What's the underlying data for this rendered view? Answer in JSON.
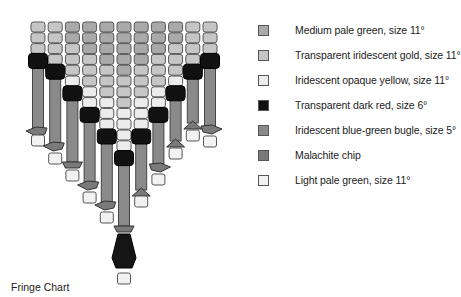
{
  "caption": "Fringe Chart",
  "colors": {
    "medium_pale_green": "#a9a9a9",
    "transparent_iridescent_gold": "#c6c6c6",
    "iridescent_opaque_yellow": "#ececec",
    "transparent_dark_red": "#111111",
    "blue_green_bugle": "#8a8a8a",
    "malachite_chip": "#7a7a7a",
    "light_pale_green": "#f2f2f2"
  },
  "legend": [
    {
      "label": "Medium pale green, size 11°",
      "color": "#a9a9a9"
    },
    {
      "label": "Transparent iridescent gold, size 11°",
      "color": "#c6c6c6"
    },
    {
      "label": "Iridescent opaque yellow, size 11°",
      "color": "#ececec"
    },
    {
      "label": "Transparent dark red, size 6°",
      "color": "#111111"
    },
    {
      "label": "Iridescent blue-green bugle, size 5°",
      "color": "#8a8a8a"
    },
    {
      "label": "Malachite chip",
      "color": "#7a7a7a"
    },
    {
      "label": "Light pale green, size 11°",
      "color": "#f2f2f2"
    }
  ],
  "fringe": {
    "column_count": 11,
    "columns": [
      {
        "index": 0,
        "seed_beads": [
          "gold",
          "gold",
          "gold"
        ],
        "dark_red_row": 3,
        "bugle_end_y": 128,
        "chip": "left",
        "end_bead_y": 135
      },
      {
        "index": 1,
        "seed_beads": [
          "gold",
          "gold",
          "gold",
          "gold"
        ],
        "dark_red_row": 4,
        "bugle_end_y": 143,
        "chip": "left",
        "end_bead_y": 153
      },
      {
        "index": 2,
        "seed_beads": [
          "green",
          "green",
          "gold",
          "gold",
          "gold",
          "yellow"
        ],
        "dark_red_row": 6,
        "bugle_end_y": 162,
        "chip": "center",
        "end_bead_y": 170
      },
      {
        "index": 3,
        "seed_beads": [
          "green",
          "green",
          "green",
          "gold",
          "gold",
          "gold",
          "yellow",
          "yellow"
        ],
        "dark_red_row": 8,
        "bugle_end_y": 182,
        "chip": "left",
        "end_bead_y": 192
      },
      {
        "index": 4,
        "seed_beads": [
          "green",
          "green",
          "green",
          "green",
          "gold",
          "gold",
          "gold",
          "yellow",
          "yellow",
          "yellow"
        ],
        "dark_red_row": 10,
        "bugle_end_y": 202,
        "chip": "left",
        "end_bead_y": 212
      },
      {
        "index": 5,
        "seed_beads": [
          "green",
          "green",
          "green",
          "green",
          "green",
          "gold",
          "gold",
          "gold",
          "yellow",
          "yellow",
          "yellow",
          "yellow"
        ],
        "dark_red_row": 12,
        "bugle_end_y": 226,
        "chip": "center",
        "pendant": true,
        "end_bead_y": 273
      },
      {
        "index": 6,
        "seed_beads": [
          "green",
          "green",
          "green",
          "green",
          "gold",
          "gold",
          "gold",
          "yellow",
          "yellow",
          "yellow"
        ],
        "dark_red_row": 10,
        "bugle_end_y": 190,
        "chip": "up",
        "end_bead_y": 196
      },
      {
        "index": 7,
        "seed_beads": [
          "green",
          "green",
          "green",
          "gold",
          "gold",
          "gold",
          "yellow",
          "yellow"
        ],
        "dark_red_row": 8,
        "bugle_end_y": 164,
        "chip": "right",
        "end_bead_y": 174
      },
      {
        "index": 8,
        "seed_beads": [
          "green",
          "green",
          "gold",
          "gold",
          "gold",
          "yellow"
        ],
        "dark_red_row": 6,
        "bugle_end_y": 141,
        "chip": "up",
        "end_bead_y": 148
      },
      {
        "index": 9,
        "seed_beads": [
          "gold",
          "gold",
          "gold",
          "gold"
        ],
        "dark_red_row": 4,
        "bugle_end_y": 123,
        "chip": "up",
        "end_bead_y": 130
      },
      {
        "index": 10,
        "seed_beads": [
          "gold",
          "gold",
          "gold"
        ],
        "dark_red_row": 3,
        "bugle_end_y": 126,
        "chip": "right",
        "end_bead_y": 136
      }
    ]
  }
}
